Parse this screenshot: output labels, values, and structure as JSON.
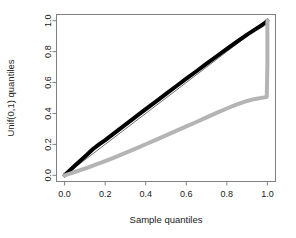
{
  "chart_data": {
    "type": "line",
    "title": "",
    "xlabel": "Sample quantiles",
    "ylabel": "Unif(0,1) quantiles",
    "xlim": [
      -0.04,
      1.04
    ],
    "ylim": [
      -0.04,
      1.04
    ],
    "xticks": [
      "0.0",
      "0.2",
      "0.4",
      "0.6",
      "0.8",
      "1.0"
    ],
    "xtick_values": [
      0.0,
      0.2,
      0.4,
      0.6,
      0.8,
      1.0
    ],
    "yticks": [
      "0.0",
      "0.2",
      "0.4",
      "0.6",
      "0.8",
      "1.0"
    ],
    "ytick_values": [
      0.0,
      0.2,
      0.4,
      0.6,
      0.8,
      1.0
    ],
    "grid": false,
    "legend": "none",
    "box": true,
    "series": [
      {
        "name": "reference-line",
        "color": "#333333",
        "width": 0.7,
        "x": [
          0.0,
          1.0
        ],
        "y": [
          0.0,
          1.0
        ]
      },
      {
        "name": "black-curve",
        "color": "#000000",
        "width": 4.0,
        "x": [
          0.0,
          0.02,
          0.05,
          0.08,
          0.11,
          0.14,
          0.17,
          0.2,
          0.25,
          0.3,
          0.35,
          0.4,
          0.45,
          0.5,
          0.55,
          0.6,
          0.65,
          0.7,
          0.75,
          0.8,
          0.85,
          0.9,
          0.94,
          0.97,
          0.99,
          1.0
        ],
        "y": [
          0.0,
          0.025,
          0.062,
          0.097,
          0.133,
          0.17,
          0.2,
          0.228,
          0.278,
          0.328,
          0.378,
          0.428,
          0.477,
          0.527,
          0.576,
          0.625,
          0.673,
          0.722,
          0.77,
          0.818,
          0.864,
          0.91,
          0.944,
          0.969,
          0.987,
          1.0
        ]
      },
      {
        "name": "gray-curve",
        "color": "#b4b4b4",
        "width": 4.0,
        "x": [
          0.0,
          0.03,
          0.07,
          0.11,
          0.15,
          0.2,
          0.25,
          0.3,
          0.35,
          0.4,
          0.45,
          0.5,
          0.55,
          0.6,
          0.65,
          0.7,
          0.75,
          0.8,
          0.85,
          0.9,
          0.94,
          0.97,
          0.985,
          0.993,
          0.997,
          1.0,
          1.0
        ],
        "y": [
          0.0,
          0.012,
          0.03,
          0.048,
          0.067,
          0.092,
          0.118,
          0.145,
          0.173,
          0.201,
          0.229,
          0.258,
          0.287,
          0.316,
          0.345,
          0.375,
          0.404,
          0.432,
          0.459,
          0.481,
          0.494,
          0.501,
          0.504,
          0.506,
          0.508,
          0.72,
          1.0
        ]
      }
    ],
    "annotations": []
  },
  "axes": {
    "x_axis_name": "x-axis",
    "y_axis_name": "y-axis"
  }
}
